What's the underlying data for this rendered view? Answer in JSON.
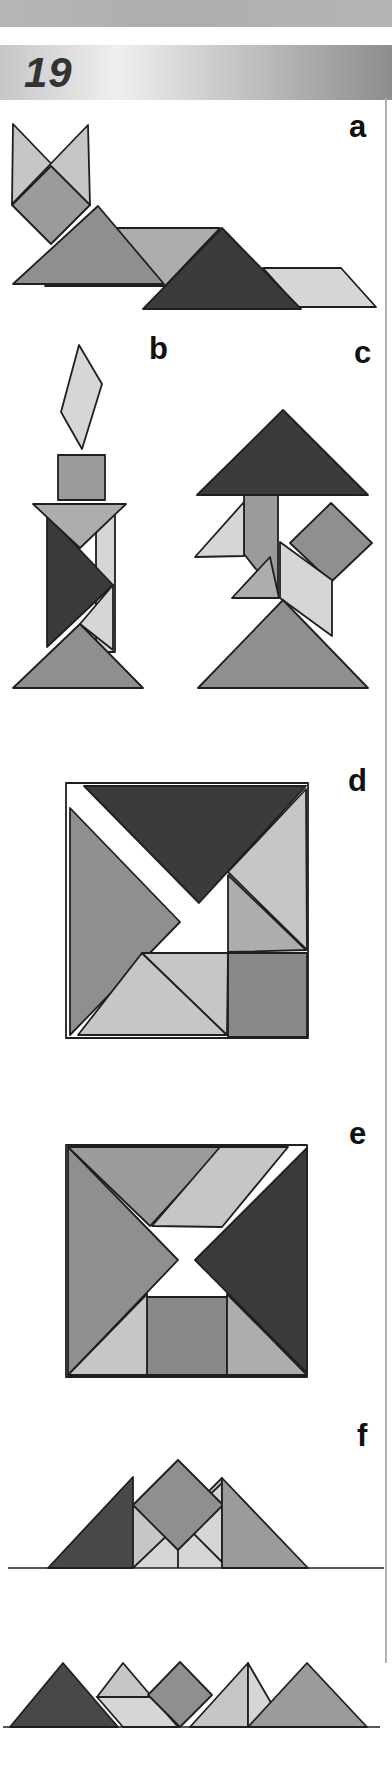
{
  "header": {
    "page_number": "19"
  },
  "figure_labels": [
    "a",
    "b",
    "c",
    "d",
    "e",
    "f"
  ],
  "palette": {
    "dark": "#3b3b3b",
    "dark2": "#484848",
    "mediumDark": "#898989",
    "medium": "#8f8f8f",
    "medium2": "#9b9b9b",
    "mediumLight": "#adadad",
    "light": "#c6c6c6",
    "lighter": "#d6d6d6",
    "white": "#ffffff",
    "outline": "#1f1f1f",
    "topBar": "#b2b2b2",
    "bannerStart": "#c6c6c6",
    "bannerMid": "#efefef",
    "bannerEnd": "#8d8d8d",
    "pageNumberColor": "#333333",
    "labelColor": "#111111",
    "marginLine": "#b0b0b0"
  }
}
